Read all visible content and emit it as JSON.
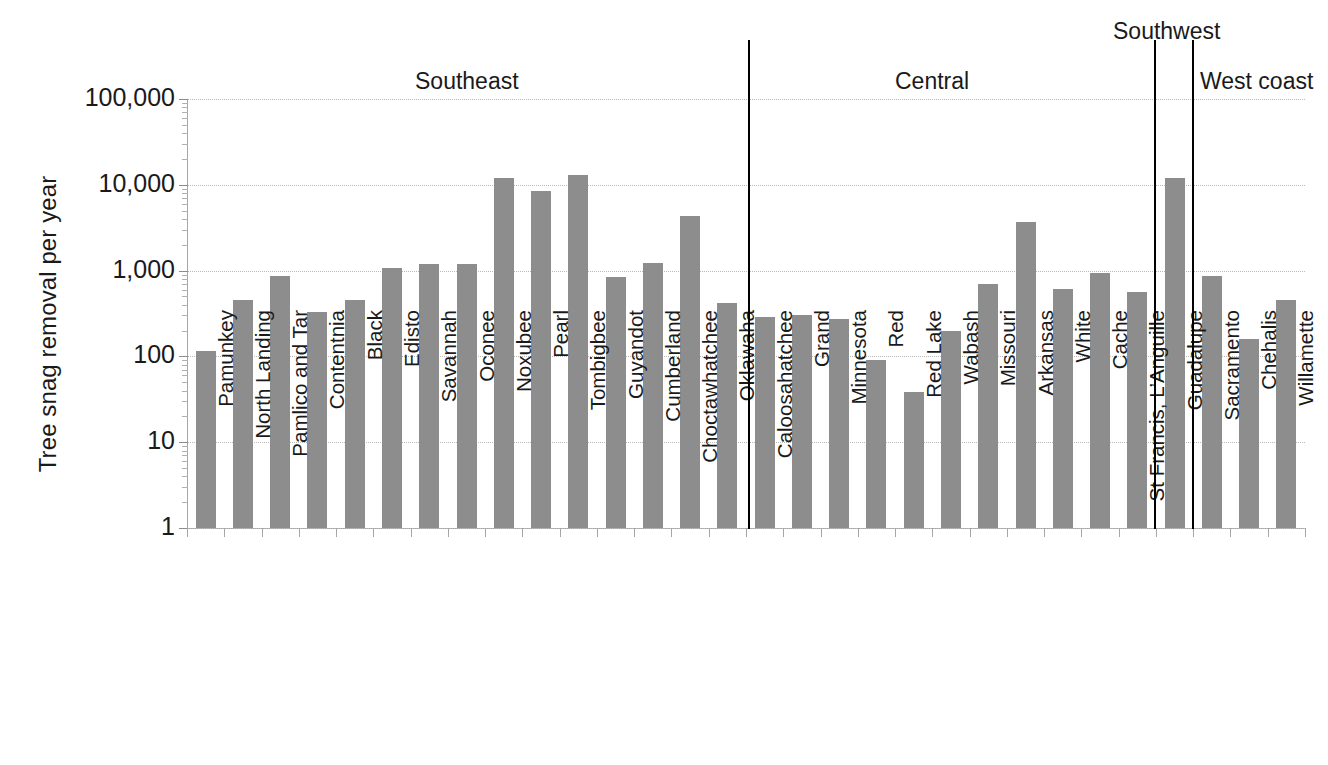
{
  "chart_data": {
    "type": "bar",
    "title": "",
    "xlabel": "",
    "ylabel": "Tree snag removal per year",
    "yscale": "log",
    "ylim": [
      1,
      100000
    ],
    "grid": true,
    "legend": "none",
    "ytick_labels": [
      "100,000",
      "10,000",
      "1,000",
      "100",
      "10",
      "1"
    ],
    "ytick_values": [
      100000,
      10000,
      1000,
      100,
      10,
      1
    ],
    "categories": [
      "Pamunkey",
      "North Landing",
      "Pamlico and Tar",
      "Contentnia",
      "Black",
      "Edisto",
      "Savannah",
      "Oconee",
      "Noxubee",
      "Pearl",
      "Tombigbee",
      "Guyandot",
      "Cumberland",
      "Choctawhatchee",
      "Oklawaha",
      "Caloosahatchee",
      "Grand",
      "Minnesota",
      "Red",
      "Red Lake",
      "Wabash",
      "Missouri",
      "Arkansas",
      "White",
      "Cache",
      "St Francis, L’Anguille",
      "Guadalupe",
      "Sacramento",
      "Chehalis",
      "Willamette"
    ],
    "values": [
      115,
      450,
      860,
      330,
      450,
      1080,
      1180,
      1180,
      12000,
      8500,
      13000,
      840,
      1220,
      4300,
      420,
      290,
      305,
      270,
      92,
      38,
      200,
      690,
      3700,
      610,
      930,
      570,
      12000,
      860,
      160,
      450
    ],
    "regions": [
      {
        "name": "Southeast",
        "label_x": 415,
        "label_y": 68,
        "first": 0,
        "last": 14
      },
      {
        "name": "Central",
        "label_x": 895,
        "label_y": 68,
        "first": 15,
        "last": 25
      },
      {
        "name": "Southwest",
        "label_x": 1113,
        "label_y": 18,
        "first": 26,
        "last": 26
      },
      {
        "name": "West coast",
        "label_x": 1200,
        "label_y": 68,
        "first": 27,
        "last": 29
      }
    ],
    "dividers": [
      {
        "x": 748,
        "top": 40,
        "height": 489
      },
      {
        "x": 1154,
        "top": 40,
        "height": 489
      },
      {
        "x": 1192,
        "top": 40,
        "height": 489
      }
    ],
    "bar_color": "#8d8d8d",
    "grid_color": "#b9b9b9",
    "axis_color": "#a6a6a6"
  }
}
